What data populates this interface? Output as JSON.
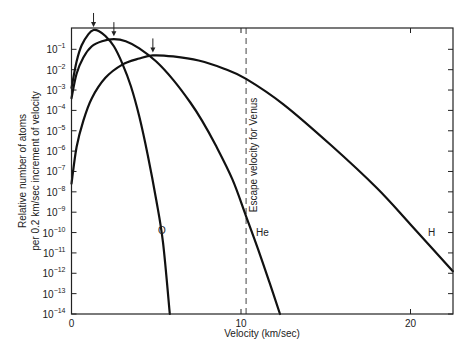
{
  "chart_data": {
    "type": "line",
    "title": "",
    "xlabel": "Velocity (km/sec)",
    "ylabel": [
      "Relative number of atoms",
      "per 0.2 km/sec increment of velocity"
    ],
    "yscale": "log",
    "xlim": [
      0,
      22.5
    ],
    "ylim_log10": [
      -14,
      0
    ],
    "x_ticks": [
      0,
      10,
      20
    ],
    "x_tick_labels": [
      "0",
      "10",
      "20"
    ],
    "y_ticks_log10": [
      -1,
      -2,
      -3,
      -4,
      -5,
      -6,
      -7,
      -8,
      -9,
      -10,
      -11,
      -12,
      -13,
      -14
    ],
    "y_tick_labels": [
      "10^-1",
      "10^-2",
      "10^-3",
      "10^-4",
      "10^-5",
      "10^-6",
      "10^-7",
      "10^-8",
      "10^-9",
      "10^-10",
      "10^-11",
      "10^-12",
      "10^-13",
      "10^-14"
    ],
    "grid": false,
    "legend": "none (curves labeled directly)",
    "annotations": [
      {
        "text": "Escape velocity for Venus",
        "type": "vertical-dashed-line",
        "x": 10.3
      },
      {
        "text": "O",
        "x": 5.4,
        "y_log10": -10.0
      },
      {
        "text": "He",
        "x": 10.8,
        "y_log10": -10.0
      },
      {
        "text": "H",
        "x": 20.5,
        "y_log10": -10.0
      },
      {
        "text": "peak-arrow",
        "x": 1.3,
        "series": "O"
      },
      {
        "text": "peak-arrow",
        "x": 2.5,
        "series": "He"
      },
      {
        "text": "peak-arrow",
        "x": 4.8,
        "series": "H"
      }
    ],
    "series": [
      {
        "name": "O",
        "points": [
          [
            0.0,
            -2.9
          ],
          [
            0.3,
            -1.6
          ],
          [
            0.6,
            -0.8
          ],
          [
            1.0,
            -0.25
          ],
          [
            1.3,
            -0.05
          ],
          [
            1.6,
            -0.1
          ],
          [
            2.0,
            -0.35
          ],
          [
            2.5,
            -0.85
          ],
          [
            3.0,
            -1.7
          ],
          [
            3.5,
            -2.8
          ],
          [
            4.0,
            -4.3
          ],
          [
            4.5,
            -6.2
          ],
          [
            5.0,
            -8.4
          ],
          [
            5.4,
            -10.5
          ],
          [
            5.8,
            -14.0
          ]
        ]
      },
      {
        "name": "He",
        "points": [
          [
            0.0,
            -3.4
          ],
          [
            0.3,
            -2.2
          ],
          [
            0.7,
            -1.4
          ],
          [
            1.2,
            -0.85
          ],
          [
            1.8,
            -0.6
          ],
          [
            2.5,
            -0.5
          ],
          [
            3.2,
            -0.6
          ],
          [
            4.0,
            -0.95
          ],
          [
            5.0,
            -1.6
          ],
          [
            6.0,
            -2.5
          ],
          [
            7.0,
            -3.6
          ],
          [
            7.7,
            -4.5
          ],
          [
            8.5,
            -5.7
          ],
          [
            9.5,
            -7.4
          ],
          [
            10.3,
            -9.2
          ],
          [
            11.0,
            -10.8
          ],
          [
            11.7,
            -12.5
          ],
          [
            12.3,
            -14.0
          ]
        ]
      },
      {
        "name": "H",
        "points": [
          [
            0.0,
            -7.6
          ],
          [
            0.3,
            -5.8
          ],
          [
            0.7,
            -4.5
          ],
          [
            1.2,
            -3.4
          ],
          [
            2.0,
            -2.4
          ],
          [
            3.0,
            -1.75
          ],
          [
            4.0,
            -1.45
          ],
          [
            4.8,
            -1.3
          ],
          [
            6.0,
            -1.35
          ],
          [
            7.5,
            -1.55
          ],
          [
            9.0,
            -1.95
          ],
          [
            10.3,
            -2.45
          ],
          [
            12.5,
            -3.7
          ],
          [
            15.3,
            -5.7
          ],
          [
            18.0,
            -7.8
          ],
          [
            20.0,
            -9.6
          ],
          [
            22.5,
            -11.9
          ]
        ]
      }
    ]
  }
}
